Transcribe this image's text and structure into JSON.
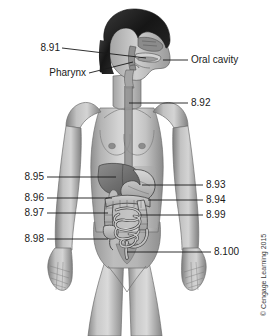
{
  "figure": {
    "background_color": "#ffffff",
    "line_color": "#1a1a1a",
    "text_color": "#1a1a1a"
  },
  "labels": {
    "left": [
      {
        "id": "label-8-91",
        "text": "8.91",
        "target": "nasal cavity"
      },
      {
        "id": "label-pharynx",
        "text": "Pharynx",
        "target": "pharynx"
      },
      {
        "id": "label-8-95",
        "text": "8.95",
        "target": "liver"
      },
      {
        "id": "label-8-96",
        "text": "8.96",
        "target": "gallbladder"
      },
      {
        "id": "label-8-97",
        "text": "8.97",
        "target": "ascending colon"
      },
      {
        "id": "label-8-98",
        "text": "8.98",
        "target": "cecum"
      }
    ],
    "right": [
      {
        "id": "label-oral-cavity",
        "text": "Oral cavity",
        "target": "oral cavity"
      },
      {
        "id": "label-8-92",
        "text": "8.92",
        "target": "esophagus"
      },
      {
        "id": "label-8-93",
        "text": "8.93",
        "target": "stomach"
      },
      {
        "id": "label-8-94",
        "text": "8.94",
        "target": "transverse colon"
      },
      {
        "id": "label-8-99",
        "text": "8.99",
        "target": "small intestine"
      },
      {
        "id": "label-8-100",
        "text": "8.100",
        "target": "rectum"
      }
    ]
  },
  "credit": {
    "text": "© Cengage Learning 2015"
  }
}
